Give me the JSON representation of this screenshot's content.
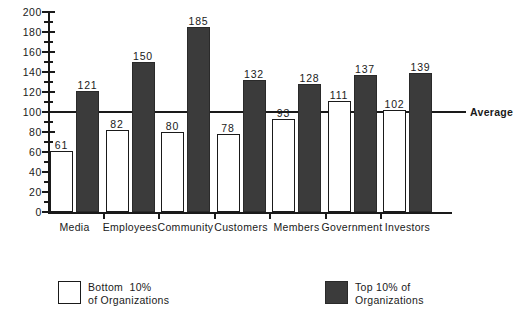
{
  "chart_data": {
    "type": "bar",
    "title": "",
    "subtitle": "",
    "xlabel": "",
    "ylabel": "",
    "ylim": [
      0,
      200
    ],
    "ytick_step": 20,
    "yticks": [
      0,
      20,
      40,
      60,
      80,
      100,
      120,
      140,
      160,
      180,
      200
    ],
    "ytick_labels": [
      "0",
      "20",
      "40",
      "60",
      "80",
      "100",
      "120",
      "140",
      "160",
      "180",
      "200"
    ],
    "grid": false,
    "legend_position": "bottom",
    "categories": [
      "Media",
      "Employees",
      "Community",
      "Customers",
      "Members",
      "Government",
      "Investors"
    ],
    "series": [
      {
        "name": "Bottom 10% of Organizations",
        "style": "open",
        "color": "#ffffff",
        "edge_color": "#1a1a1a",
        "values": [
          61,
          82,
          80,
          78,
          93,
          111,
          102
        ]
      },
      {
        "name": "Top 10% of Organizations",
        "style": "filled",
        "color": "#3b3b3b",
        "edge_color": "#2a2a2a",
        "values": [
          121,
          150,
          185,
          132,
          128,
          137,
          139
        ]
      }
    ],
    "annotations": [
      {
        "name": "average-reference-line",
        "label": "Average",
        "value": 100,
        "orientation": "horizontal"
      }
    ]
  },
  "legend": {
    "items": [
      {
        "swatch": "open",
        "line1": "Bottom  10%",
        "line2": "of Organizations"
      },
      {
        "swatch": "filled",
        "line1": "Top 10% of",
        "line2": "Organizations"
      }
    ]
  },
  "colors": {
    "axis": "#1a1a1a",
    "text": "#1a1a1a",
    "background": "#ffffff",
    "series_low": "#ffffff",
    "series_high": "#3b3b3b"
  }
}
